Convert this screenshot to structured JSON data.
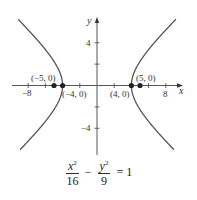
{
  "chart_data": {
    "type": "line",
    "title": "",
    "xlabel": "x",
    "ylabel": "y",
    "xlim": [
      -9.5,
      10
    ],
    "ylim": [
      -6,
      6.2
    ],
    "grid": false,
    "x_ticks": [
      -8,
      -6,
      -4,
      -2,
      2,
      4,
      6,
      8
    ],
    "x_tick_labels": [
      {
        "value": -8,
        "label": "−8"
      },
      {
        "value": 8,
        "label": "8"
      }
    ],
    "y_ticks": [
      -4,
      -2,
      2,
      4
    ],
    "y_tick_labels": [
      {
        "value": 4,
        "label": "4"
      },
      {
        "value": -4,
        "label": "−4"
      }
    ],
    "series": [
      {
        "name": "hyperbola",
        "equation": "x^2/16 - y^2/9 = 1",
        "a": 4,
        "b": 3,
        "branches": [
          "left",
          "right"
        ],
        "y_range": [
          -6,
          6.2
        ]
      }
    ],
    "points": [
      {
        "x": -5,
        "y": 0,
        "label": "(−5, 0)",
        "role": "focus"
      },
      {
        "x": -4,
        "y": 0,
        "label": "(−4, 0)",
        "role": "vertex"
      },
      {
        "x": 4,
        "y": 0,
        "label": "(4, 0)",
        "role": "vertex"
      },
      {
        "x": 5,
        "y": 0,
        "label": "(5, 0)",
        "role": "focus"
      }
    ],
    "equation_caption": {
      "term1": {
        "num_var": "x",
        "num_exp": "2",
        "den": "16"
      },
      "operator": "−",
      "term2": {
        "num_var": "y",
        "num_exp": "2",
        "den": "9"
      },
      "equals": "= 1"
    }
  },
  "colors": {
    "curve": "#555555",
    "axis": "#444444",
    "point": "#222222",
    "text": "#333333"
  }
}
